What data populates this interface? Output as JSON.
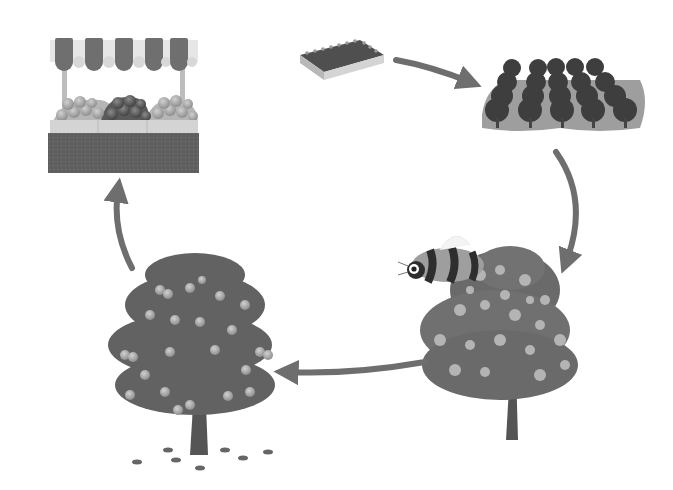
{
  "diagram": {
    "title": "Fruit tree life cycle",
    "type": "cycle",
    "colors": {
      "background": "#ffffff",
      "arrow": "#6e6e6e",
      "foliage_dark": "#5e5e5e",
      "foliage_light": "#a8a8a8",
      "fruit": "#9a9a9a",
      "trunk": "#555555",
      "stall_base": "#6a6a6a",
      "awning_stripe": "#6f6f6f"
    },
    "stages": [
      {
        "id": "nursery",
        "label": "Seedling nursery tray"
      },
      {
        "id": "orchard",
        "label": "Orchard of young trees"
      },
      {
        "id": "pollination",
        "label": "Flowering tree with bee"
      },
      {
        "id": "fruiting",
        "label": "Fruit-bearing tree"
      },
      {
        "id": "market",
        "label": "Market fruit stall"
      }
    ],
    "arrows": [
      {
        "from": "nursery",
        "to": "orchard"
      },
      {
        "from": "orchard",
        "to": "pollination"
      },
      {
        "from": "pollination",
        "to": "fruiting"
      },
      {
        "from": "fruiting",
        "to": "market"
      },
      {
        "from": "market",
        "to": "nursery"
      }
    ]
  }
}
